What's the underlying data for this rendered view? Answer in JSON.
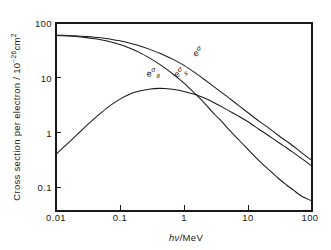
{
  "chart_data": {
    "type": "line",
    "title": "",
    "xlabel": "hν/MeV",
    "ylabel": "Cross section per electron / 10⁻²⁶cm²",
    "xscale": "log",
    "yscale": "log",
    "xlim": [
      0.01,
      100
    ],
    "ylim": [
      0.1,
      100
    ],
    "grid": false,
    "legend_position": "inline-annotations",
    "xticks": [
      "0.01",
      "0.1",
      "1",
      "10",
      "100"
    ],
    "xtick_values": [
      0.01,
      0.1,
      1,
      10,
      100
    ],
    "yticks": [
      "0.1",
      "1",
      "10",
      "100"
    ],
    "ytick_values": [
      0.1,
      1,
      10,
      100
    ],
    "x": [
      0.01,
      0.015,
      0.02,
      0.03,
      0.04,
      0.05,
      0.07,
      0.1,
      0.15,
      0.2,
      0.3,
      0.4,
      0.5,
      0.7,
      1.0,
      1.5,
      2.0,
      3.0,
      4.0,
      5.0,
      7.0,
      10.0,
      15.0,
      20.0,
      30.0,
      40.0,
      50.0,
      70.0,
      100.0
    ],
    "series": [
      {
        "name": "ₑσ",
        "label": "eσ",
        "label_sup": "σ",
        "label_sub": "",
        "description": "total Klein-Nishina cross section per electron",
        "values": [
          64.0,
          63.2,
          62.4,
          60.8,
          59.4,
          58.0,
          55.4,
          52.0,
          47.0,
          43.3,
          37.6,
          33.5,
          30.4,
          25.8,
          21.1,
          16.0,
          12.9,
          9.5,
          7.6,
          6.4,
          4.9,
          3.7,
          2.7,
          2.2,
          1.6,
          1.3,
          1.1,
          0.84,
          0.64
        ],
        "endpoint_left": 64.0,
        "endpoint_right": 0.64
      },
      {
        "name": "ₑσₛ",
        "label": "eσs",
        "label_sup": "σ",
        "label_sub": "s",
        "description": "Compton scattering (scatter) cross section per electron",
        "values": [
          63.2,
          62.0,
          60.8,
          58.4,
          56.2,
          54.2,
          50.4,
          45.5,
          38.8,
          34.0,
          27.0,
          22.5,
          19.2,
          14.8,
          11.0,
          7.4,
          5.5,
          3.5,
          2.6,
          2.0,
          1.4,
          0.96,
          0.63,
          0.48,
          0.33,
          0.26,
          0.22,
          0.17,
          0.145
        ],
        "endpoint_left": 63.2,
        "endpoint_right": 0.145
      },
      {
        "name": "ₑσₐ",
        "label": "eσa",
        "label_sup": "σ",
        "label_sub": "a",
        "description": "Compton absorption (energy transfer) cross section per electron, peaks near 0.7 MeV",
        "values": [
          0.8,
          1.18,
          1.55,
          2.3,
          3.0,
          3.65,
          4.8,
          6.1,
          7.5,
          8.2,
          8.85,
          9.05,
          9.0,
          8.7,
          8.1,
          7.2,
          6.45,
          5.3,
          4.55,
          4.0,
          3.3,
          2.65,
          2.0,
          1.65,
          1.24,
          1.02,
          0.87,
          0.68,
          0.52
        ],
        "endpoint_left": 0.8,
        "endpoint_right": 0.52,
        "peak_x": 0.6,
        "peak_y": 9.05
      }
    ],
    "annotations": [
      {
        "id": "label-sigma-total",
        "text": "eσ",
        "x_px": 195,
        "y_px": 57,
        "rotation": -26
      },
      {
        "id": "label-sigma-s",
        "text": "eσs",
        "x_px": 178,
        "y_px": 76,
        "rotation": -26
      },
      {
        "id": "label-sigma-a",
        "text": "eσa",
        "x_px": 152,
        "y_px": 76,
        "rotation": -8
      }
    ]
  },
  "axes": {
    "y_title_parts": {
      "main": "Cross section per electron / 10",
      "exponent": "−26",
      "unit": "cm",
      "unit_exponent": "2"
    },
    "x_title_parts": {
      "h": "h",
      "nu": "ν",
      "rest": "/MeV"
    }
  },
  "colors": {
    "ink": "#1a1a1a",
    "background": "#ffffff"
  }
}
